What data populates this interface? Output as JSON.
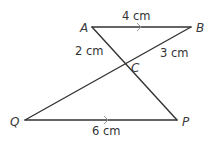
{
  "diagram": {
    "points": {
      "A": {
        "label": "A",
        "x": 92,
        "y": 27
      },
      "B": {
        "label": "B",
        "x": 191,
        "y": 27
      },
      "C": {
        "label": "C",
        "x": 124,
        "y": 65
      },
      "Q": {
        "label": "Q",
        "x": 25,
        "y": 120
      },
      "P": {
        "label": "P",
        "x": 177,
        "y": 120
      }
    },
    "segments": [
      {
        "from": "A",
        "to": "B",
        "length_label": "4 cm",
        "parallel_mark": true
      },
      {
        "from": "A",
        "to": "C",
        "length_label": "2 cm"
      },
      {
        "from": "B",
        "to": "C",
        "length_label": "3 cm"
      },
      {
        "from": "Q",
        "to": "P",
        "length_label": "6 cm",
        "parallel_mark": true
      },
      {
        "from": "C",
        "to": "P"
      },
      {
        "from": "C",
        "to": "Q"
      }
    ],
    "labels": {
      "A": "A",
      "B": "B",
      "C": "C",
      "Q": "Q",
      "P": "P",
      "AB": "4 cm",
      "AC": "2 cm",
      "BC": "3 cm",
      "QP": "6 cm"
    },
    "colors": {
      "line": "#333333",
      "text": "#333333",
      "parallel_arrow": "#9a9a9a"
    }
  }
}
